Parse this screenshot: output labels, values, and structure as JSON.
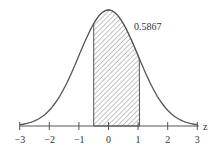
{
  "chart_data": {
    "type": "area",
    "title": "",
    "xlabel": "z",
    "ylabel": "",
    "xlim": [
      -3,
      3
    ],
    "x_ticks": [
      "−3",
      "−2",
      "−1",
      "0",
      "1",
      "2",
      "3"
    ],
    "shaded_region": {
      "from": -0.5,
      "to": 1.05,
      "area": 0.5867
    },
    "annotation": "0.5867",
    "grid": false,
    "legend": "none"
  }
}
